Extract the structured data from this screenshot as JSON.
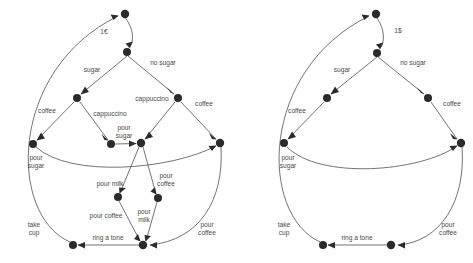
{
  "figure": {
    "title": "",
    "background_color": "#ffffff",
    "node_color": "#2b2b2b",
    "edge_color": "#5b5b5b",
    "label_color": "#4a4a4a"
  },
  "panels": [
    {
      "id": "left-panel",
      "name": "detailed-coffee-machine-graph",
      "nodes": [
        {
          "id": "L0",
          "x": 125,
          "y": 14,
          "r": 4.2
        },
        {
          "id": "L1",
          "x": 127,
          "y": 52,
          "r": 4.0
        },
        {
          "id": "L2",
          "x": 77,
          "y": 98,
          "r": 4.0
        },
        {
          "id": "L3",
          "x": 178,
          "y": 98,
          "r": 4.0
        },
        {
          "id": "L4",
          "x": 33,
          "y": 144,
          "r": 4.0
        },
        {
          "id": "L5",
          "x": 111,
          "y": 144,
          "r": 4.0
        },
        {
          "id": "L6",
          "x": 141,
          "y": 143,
          "r": 4.2
        },
        {
          "id": "L7",
          "x": 220,
          "y": 143,
          "r": 4.2
        },
        {
          "id": "L8",
          "x": 118,
          "y": 197,
          "r": 4.0
        },
        {
          "id": "L9",
          "x": 158,
          "y": 198,
          "r": 4.0
        },
        {
          "id": "L10",
          "x": 73,
          "y": 245,
          "r": 4.0
        },
        {
          "id": "L11",
          "x": 143,
          "y": 245,
          "r": 4.2
        }
      ],
      "edges": [
        {
          "from": "L0",
          "to": "L1",
          "label": "1€",
          "label_x": 104,
          "label_y": 32
        },
        {
          "from": "L1",
          "to": "L2",
          "label": "sugar",
          "label_x": 92,
          "label_y": 70
        },
        {
          "from": "L1",
          "to": "L3",
          "label": "no sugar",
          "label_x": 163,
          "label_y": 63
        },
        {
          "from": "L2",
          "to": "L4",
          "label": "coffee",
          "label_x": 47,
          "label_y": 111
        },
        {
          "from": "L2",
          "to": "L5",
          "label": "cappuccino",
          "label_x": 110,
          "label_y": 114
        },
        {
          "from": "L3",
          "to": "L6",
          "label": "cappuccino",
          "label_x": 152,
          "label_y": 99
        },
        {
          "from": "L3",
          "to": "L7",
          "label": "coffee",
          "label_x": 204,
          "label_y": 104
        },
        {
          "from": "L5",
          "to": "L6",
          "label": "pour sugar",
          "label_x": 124,
          "label_y": 131
        },
        {
          "from": "L4",
          "to": "L7",
          "label": "pour sugar",
          "label_x": 36,
          "label_y": 161
        },
        {
          "from": "L6",
          "to": "L8",
          "label": "pour milk",
          "label_x": 110,
          "label_y": 184
        },
        {
          "from": "L6",
          "to": "L9",
          "label": "pour coffee",
          "label_x": 166,
          "label_y": 180
        },
        {
          "from": "L8",
          "to": "L11",
          "label": "pour coffee",
          "label_x": 106,
          "label_y": 216
        },
        {
          "from": "L9",
          "to": "L11",
          "label": "pour milk",
          "label_x": 143,
          "label_y": 216
        },
        {
          "from": "L7",
          "to": "L11",
          "label": "pour coffee",
          "label_x": 206,
          "label_y": 228
        },
        {
          "from": "L11",
          "to": "L10",
          "label": "ring a tone",
          "label_x": 108,
          "label_y": 238
        },
        {
          "from": "L10",
          "to": "L0",
          "label": "take cup",
          "label_x": 34,
          "label_y": 228
        }
      ]
    },
    {
      "id": "right-panel",
      "name": "abstracted-coffee-machine-graph",
      "nodes": [
        {
          "id": "R0",
          "x": 376,
          "y": 14,
          "r": 4.2
        },
        {
          "id": "R1",
          "x": 377,
          "y": 53,
          "r": 4.0
        },
        {
          "id": "R2",
          "x": 327,
          "y": 98,
          "r": 4.0
        },
        {
          "id": "R3",
          "x": 428,
          "y": 98,
          "r": 4.0
        },
        {
          "id": "R4",
          "x": 284,
          "y": 143,
          "r": 4.0
        },
        {
          "id": "R5",
          "x": 461,
          "y": 143,
          "r": 4.2
        },
        {
          "id": "R6",
          "x": 323,
          "y": 245,
          "r": 4.0
        },
        {
          "id": "R7",
          "x": 391,
          "y": 245,
          "r": 4.2
        }
      ],
      "edges": [
        {
          "from": "R0",
          "to": "R1",
          "label": "1$",
          "label_x": 398,
          "label_y": 31
        },
        {
          "from": "R1",
          "to": "R2",
          "label": "sugar",
          "label_x": 342,
          "label_y": 70
        },
        {
          "from": "R1",
          "to": "R3",
          "label": "no sugar",
          "label_x": 413,
          "label_y": 63
        },
        {
          "from": "R2",
          "to": "R4",
          "label": "coffee",
          "label_x": 297,
          "label_y": 111
        },
        {
          "from": "R3",
          "to": "R5",
          "label": "coffee",
          "label_x": 452,
          "label_y": 104
        },
        {
          "from": "R4",
          "to": "R5",
          "label": "pour sugar",
          "label_x": 287,
          "label_y": 161
        },
        {
          "from": "R5",
          "to": "R7",
          "label": "pour coffee",
          "label_x": 447,
          "label_y": 228
        },
        {
          "from": "R7",
          "to": "R6",
          "label": "ring a tone",
          "label_x": 357,
          "label_y": 238
        },
        {
          "from": "R6",
          "to": "R0",
          "label": "take cup",
          "label_x": 284,
          "label_y": 228
        }
      ]
    }
  ]
}
